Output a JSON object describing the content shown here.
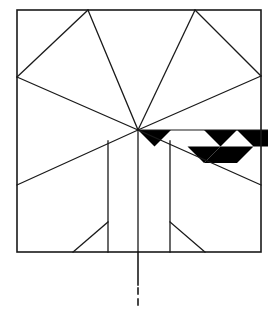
{
  "figure": {
    "type": "line-drawing",
    "canvas": {
      "width": 268,
      "height": 316,
      "background": "#ffffff"
    },
    "colors": {
      "stroke": "#1a1a1a",
      "fill_dark": "#000000",
      "fill_light": "#ffffff",
      "background": "#ffffff"
    },
    "stroke_widths": {
      "frame": 1.6,
      "interior": 1.3,
      "thin": 1.1,
      "centerline": 1.6
    }
  },
  "geometry": {
    "frame": {
      "name": "outer-rectangle",
      "left": 17,
      "top": 10,
      "right": 261,
      "bottom": 252
    },
    "center_point": {
      "x": 138,
      "y": 130
    },
    "apex_left": {
      "x": 88,
      "y": 10
    },
    "apex_right": {
      "x": 195,
      "y": 10
    },
    "vertex_left": {
      "x": 17,
      "y": 77
    },
    "vertex_right": {
      "x": 261,
      "y": 76
    },
    "diagonal_left_end": {
      "x": 17,
      "y": 185
    },
    "diagonal_right_end": {
      "x": 261,
      "y": 185
    },
    "vertical_lines": [
      {
        "name": "inner-vertical-left",
        "x": 108,
        "y1": 141,
        "y2": 252
      },
      {
        "name": "center-vertical",
        "x": 138,
        "y1": 130,
        "y2": 285
      },
      {
        "name": "inner-vertical-right",
        "x": 170,
        "y1": 141,
        "y2": 252
      }
    ],
    "foot_diagonals": [
      {
        "name": "foot-diagonal-left",
        "x1": 108,
        "y1": 222,
        "x2": 73,
        "y2": 252
      },
      {
        "name": "foot-diagonal-right",
        "x1": 170,
        "y1": 222,
        "x2": 205,
        "y2": 252
      }
    ],
    "center_axis": {
      "name": "center-axis-line",
      "solid_from": 252,
      "solid_to": 285,
      "dash_from": 288,
      "dash_to": 306,
      "x": 138
    },
    "band_horizontal": {
      "name": "band-top-line",
      "x1": 138,
      "y1": 130,
      "x2": 268,
      "y2": 130
    },
    "band": {
      "name": "checkered-diamond-band",
      "top_y": 130,
      "zigzag_low_y": 163,
      "points_x": [
        138,
        171,
        204,
        237,
        268
      ],
      "dark_cells": [
        "triangle-1",
        "diamond-2",
        "diamond-4"
      ],
      "light_cells": [
        "diamond-1",
        "diamond-3"
      ]
    },
    "radiating_lines": [
      {
        "name": "ray-to-apex-left",
        "to_x": 88,
        "to_y": 10
      },
      {
        "name": "ray-to-apex-right",
        "to_x": 195,
        "to_y": 10
      },
      {
        "name": "ray-to-vertex-left",
        "to_x": 17,
        "to_y": 77
      },
      {
        "name": "ray-to-vertex-right",
        "to_x": 261,
        "to_y": 76
      },
      {
        "name": "ray-to-lower-left",
        "to_x": 17,
        "to_y": 185
      },
      {
        "name": "ray-to-lower-right",
        "to_x": 261,
        "to_y": 185
      },
      {
        "name": "ray-down-center",
        "to_x": 138,
        "to_y": 285
      }
    ]
  },
  "labels": {
    "none_visible": ""
  }
}
